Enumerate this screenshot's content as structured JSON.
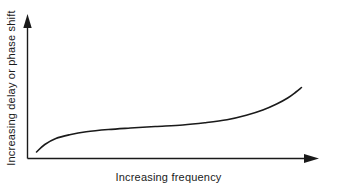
{
  "figure": {
    "background_color": "#ffffff",
    "ink_color": "#1a1a1a",
    "width": 337,
    "height": 192
  },
  "chart_data": {
    "type": "line",
    "title": "",
    "subtitle": "",
    "xlabel": "Increasing frequency",
    "ylabel": "Increasing delay or phase shift",
    "grid": false,
    "legend": null,
    "legend_position": "none",
    "axis_style": "arrow-headed, unlabeled qualitative axes",
    "xlim": [
      0,
      100
    ],
    "ylim": [
      0,
      100
    ],
    "xticks": [],
    "yticks": [],
    "xtick_labels": [],
    "ytick_labels": [],
    "annotations": [],
    "series": [
      {
        "name": "delay-vs-frequency",
        "color": "#1a1a1a",
        "line_width": 1.6,
        "x": [
          2,
          5,
          9,
          14,
          20,
          28,
          36,
          45,
          55,
          63,
          71,
          78,
          84,
          89,
          93,
          96,
          98
        ],
        "y": [
          4,
          14,
          22,
          27,
          31,
          34,
          36,
          38,
          40,
          43,
          47,
          53,
          60,
          68,
          76,
          84,
          90
        ]
      }
    ]
  },
  "axes": {
    "x_axis": {
      "label": "Increasing frequency",
      "arrow": "right-arrow-icon"
    },
    "y_axis": {
      "label": "Increasing delay or phase shift",
      "arrow": "up-arrow-icon"
    }
  }
}
